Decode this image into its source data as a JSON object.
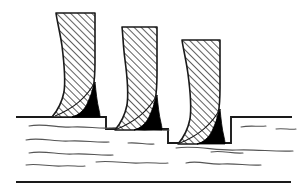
{
  "figure": {
    "caption": "",
    "width": 306,
    "height": 191,
    "background_color": "#ffffff",
    "line_color": "#1a1a1a",
    "fill_black": "#000000",
    "hatch_color": "#2b2b2b",
    "wave_color": "#555555"
  },
  "chart_data": {
    "type": "diagram",
    "elements": [
      {
        "name": "tooth-1",
        "label": "left tooth",
        "top_y": 13,
        "top_x_range": [
          56,
          95
        ],
        "tip_x": 52,
        "tip_y": 117,
        "black_wedge": true
      },
      {
        "name": "tooth-2",
        "label": "middle tooth",
        "top_y": 27,
        "top_x_range": [
          122,
          157
        ],
        "tip_x": 115,
        "tip_y": 130,
        "black_wedge": true
      },
      {
        "name": "tooth-3",
        "label": "right tooth",
        "top_y": 40,
        "top_x_range": [
          182,
          220
        ],
        "tip_x": 178,
        "tip_y": 144,
        "black_wedge": true
      }
    ],
    "ground_profile": [
      {
        "x": 16,
        "y": 117
      },
      {
        "x": 106,
        "y": 117
      },
      {
        "x": 106,
        "y": 129
      },
      {
        "x": 168,
        "y": 129
      },
      {
        "x": 168,
        "y": 143
      },
      {
        "x": 231,
        "y": 143
      },
      {
        "x": 231,
        "y": 117
      },
      {
        "x": 292,
        "y": 117
      }
    ],
    "baseline": {
      "x_start": 16,
      "x_end": 291,
      "y": 182,
      "thickness": 2
    },
    "wave_line_count": 9,
    "hatch_angle_deg": 45,
    "hatch_spacing_px": 5
  }
}
